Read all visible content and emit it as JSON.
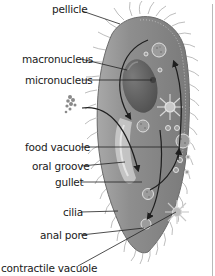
{
  "diagram": {
    "colors": {
      "body_fill": "#8a8a8a",
      "body_dark": "#6e6e6e",
      "macronucleus": "#5a5a5a",
      "cilia": "#9a9a9a",
      "arrow": "#1e1e1e",
      "leader_line": "#222222",
      "text": "#1a1a1a"
    },
    "labels": [
      {
        "id": "pellicle",
        "text": "pellicle"
      },
      {
        "id": "macronucleus",
        "text": "macronucleus"
      },
      {
        "id": "micronucleus",
        "text": "micronucleus"
      },
      {
        "id": "food-vacuole",
        "text": "food vacuole"
      },
      {
        "id": "oral-groove",
        "text": "oral groove"
      },
      {
        "id": "gullet",
        "text": "gullet"
      },
      {
        "id": "cilia",
        "text": "cilia"
      },
      {
        "id": "anal-pore",
        "text": "anal pore"
      },
      {
        "id": "contractile-vacuole",
        "text": "contractile vacuole"
      }
    ]
  }
}
